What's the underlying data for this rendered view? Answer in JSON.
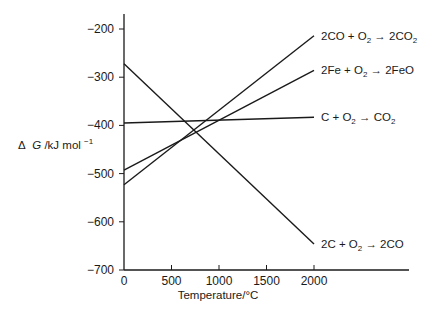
{
  "chart_data": {
    "type": "line",
    "title": "",
    "xlabel": "Temperature/°C",
    "ylabel": "ΔG/kJ mol⁻¹",
    "xlim": [
      0,
      2800
    ],
    "ylim": [
      -700,
      -170
    ],
    "x_ticks": [
      0,
      500,
      1000,
      1500,
      2000
    ],
    "y_ticks": [
      -200,
      -300,
      -400,
      -500,
      -600,
      -700
    ],
    "grid": false,
    "legend_position": "inline-right",
    "series": [
      {
        "name": "2CO + O2 → 2CO2",
        "label_main": "2CO + O",
        "label_sub": "2",
        "label_tail": " → 2CO",
        "label_tail_sub": "2",
        "x": [
          0,
          2000
        ],
        "values": [
          -523,
          -214
        ]
      },
      {
        "name": "2Fe + O2 → 2FeO",
        "label_main": "2Fe + O",
        "label_sub": "2",
        "label_tail": " → 2FeO",
        "label_tail_sub": "",
        "x": [
          0,
          2000
        ],
        "values": [
          -493,
          -286
        ]
      },
      {
        "name": "C + O2 → CO2",
        "label_main": "C + O",
        "label_sub": "2",
        "label_tail": " → CO",
        "label_tail_sub": "2",
        "x": [
          0,
          2000
        ],
        "values": [
          -395,
          -383
        ]
      },
      {
        "name": "2C + O2 → 2CO",
        "label_main": "2C + O",
        "label_sub": "2",
        "label_tail": " → 2CO",
        "label_tail_sub": "",
        "x": [
          0,
          2000
        ],
        "values": [
          -272,
          -646
        ]
      }
    ]
  },
  "axis": {
    "x_title": "Temperature/°C",
    "y_title_delta": "Δ",
    "y_title_g": "G",
    "y_title_unit": "/kJ mol",
    "y_title_exp": "−1",
    "x_tick_labels": [
      "0",
      "500",
      "1000",
      "1500",
      "2000"
    ],
    "y_tick_labels": [
      "−200",
      "−300",
      "−400",
      "−500",
      "−600",
      "−700"
    ]
  },
  "colors": {
    "ink": "#1a1a1a",
    "background": "#ffffff"
  }
}
